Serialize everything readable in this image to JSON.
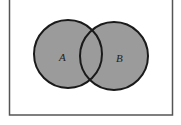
{
  "diagram": {
    "type": "venn",
    "universe": {
      "x": 9,
      "y": -5,
      "width": 163,
      "height": 120,
      "stroke": "#555555"
    },
    "sets": [
      {
        "label": "A",
        "cx": 68,
        "cy": 54,
        "r": 34,
        "label_x": 62,
        "label_y": 61
      },
      {
        "label": "B",
        "cx": 114,
        "cy": 56,
        "r": 34,
        "label_x": 118,
        "label_y": 62
      }
    ],
    "colors": {
      "fill": "#9b9b9b",
      "stroke": "#1a1a1a",
      "background": "#ffffff"
    },
    "shaded_region": "A union B"
  }
}
